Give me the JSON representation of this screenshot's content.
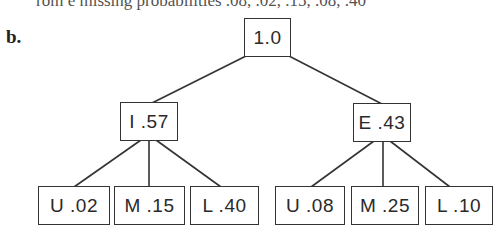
{
  "clipped_text": "rom e missing probabilities .08, .02, .15, .08, .40",
  "part_label": "b.",
  "tree": {
    "root": {
      "label": "1.0"
    },
    "level1": [
      {
        "label": "I .57"
      },
      {
        "label": "E .43"
      }
    ],
    "leaves": [
      {
        "label": "U .02"
      },
      {
        "label": "M .15"
      },
      {
        "label": "L .40"
      },
      {
        "label": "U .08"
      },
      {
        "label": "M .25"
      },
      {
        "label": "L .10"
      }
    ]
  }
}
